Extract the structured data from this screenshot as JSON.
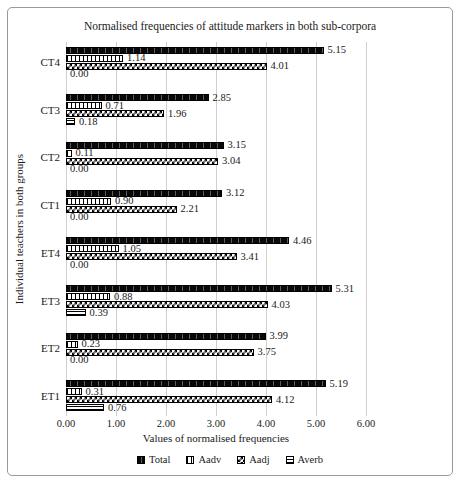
{
  "chart_data": {
    "type": "bar",
    "orientation": "horizontal",
    "title": "Normalised frequencies of attitude markers in both sub-corpora",
    "xlabel": "Values of normalised frequencies",
    "ylabel": "Individual teachers in both groups",
    "xlim": [
      0,
      6
    ],
    "xticks": [
      "0.00",
      "1.00",
      "2.00",
      "3.00",
      "4.00",
      "5.00",
      "6.00"
    ],
    "grid": true,
    "legend_position": "bottom",
    "categories": [
      "CT4",
      "CT3",
      "CT2",
      "CT1",
      "ET4",
      "ET3",
      "ET2",
      "ET1"
    ],
    "series": [
      {
        "name": "Total",
        "pattern": "dark",
        "values": [
          5.15,
          2.85,
          3.15,
          3.12,
          4.46,
          5.31,
          3.99,
          5.19
        ]
      },
      {
        "name": "Aadv",
        "pattern": "vlines",
        "values": [
          1.14,
          0.71,
          0.11,
          0.9,
          1.05,
          0.88,
          0.23,
          0.31
        ]
      },
      {
        "name": "Aadj",
        "pattern": "checker",
        "values": [
          4.01,
          1.96,
          3.04,
          2.21,
          3.41,
          4.03,
          3.75,
          4.12
        ]
      },
      {
        "name": "Averb",
        "pattern": "hlines",
        "values": [
          0.0,
          0.18,
          0.0,
          0.0,
          0.0,
          0.39,
          0.0,
          0.76
        ]
      }
    ],
    "value_label_format": "2dp",
    "colors": {
      "text": "#1a1a1a",
      "gridline": "#cfcfcf",
      "frame_border": "#999999",
      "bar_border": "#000000",
      "pattern_fg": "#000000",
      "pattern_bg": "#ffffff",
      "total_fill": "#383838"
    }
  }
}
